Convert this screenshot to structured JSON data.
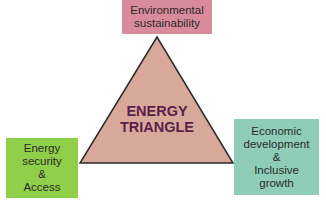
{
  "diagram": {
    "center": {
      "line1": "ENERGY",
      "line2": "TRIANGLE",
      "color": "#5c1e4a",
      "fill": "#d8a99a"
    },
    "nodes": {
      "top": {
        "lines": [
          "Environmental",
          "sustainability"
        ],
        "color": "#d98a9b"
      },
      "left": {
        "lines": [
          "Energy",
          "security",
          "&",
          "Access"
        ],
        "color": "#8fcf4a"
      },
      "right": {
        "lines": [
          "Economic",
          "development",
          "&",
          "Inclusive",
          "growth"
        ],
        "color": "#8fcdb8"
      }
    }
  }
}
